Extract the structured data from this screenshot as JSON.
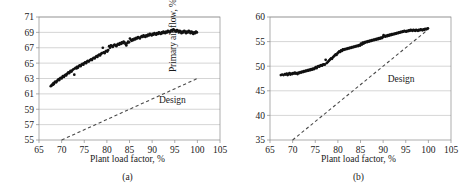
{
  "figure": {
    "panels": [
      "a",
      "b"
    ]
  },
  "chart_data": [
    {
      "type": "scatter",
      "panel": "a",
      "caption": "(a)",
      "title": "",
      "xlabel": "Plant load factor, %",
      "ylabel": "Pressure gain, % of fan capacity",
      "xlim": [
        65,
        105
      ],
      "ylim": [
        55,
        71
      ],
      "xticks": [
        65,
        70,
        75,
        80,
        85,
        90,
        95,
        100,
        105
      ],
      "yticks": [
        55,
        57,
        59,
        61,
        63,
        65,
        67,
        69,
        71
      ],
      "grid": "horizontal",
      "legend": "none",
      "annotations": [
        {
          "text": "Design",
          "x": 91.5,
          "y": 59.8
        }
      ],
      "series": [
        {
          "name": "Design",
          "type": "line",
          "style": "dashed",
          "points": [
            [
              70,
              55
            ],
            [
              100,
              63
            ]
          ]
        },
        {
          "name": "Measured",
          "type": "scatter",
          "marker": "circle",
          "x": [
            67.6,
            67.8,
            67.9,
            68.1,
            68.2,
            68.3,
            68.5,
            68.6,
            68.8,
            69.0,
            69.2,
            69.3,
            69.5,
            69.6,
            69.8,
            70.0,
            70.2,
            70.3,
            70.5,
            70.7,
            70.9,
            71.0,
            71.2,
            71.4,
            71.5,
            71.7,
            71.9,
            72.0,
            72.2,
            72.4,
            72.6,
            72.8,
            72.9,
            73.1,
            73.3,
            73.4,
            73.6,
            73.8,
            74.0,
            74.2,
            74.4,
            74.6,
            74.8,
            75.0,
            75.2,
            75.4,
            75.6,
            75.8,
            76.0,
            76.3,
            76.5,
            76.7,
            76.9,
            77.1,
            77.3,
            77.5,
            77.7,
            77.9,
            78.1,
            78.3,
            78.5,
            78.7,
            78.9,
            79.1,
            79.3,
            79.5,
            79.7,
            79.9,
            80.1,
            80.3,
            80.5,
            80.7,
            80.9,
            81.1,
            81.3,
            81.5,
            81.7,
            81.9,
            82.1,
            82.3,
            82.5,
            82.7,
            82.9,
            83.1,
            83.3,
            83.5,
            83.7,
            83.9,
            84.1,
            84.3,
            84.5,
            84.7,
            84.9,
            85.1,
            85.3,
            85.5,
            85.7,
            85.9,
            86.1,
            86.3,
            86.5,
            86.7,
            86.9,
            87.1,
            87.3,
            87.5,
            87.7,
            87.9,
            88.1,
            88.3,
            88.5,
            88.7,
            88.9,
            89.1,
            89.3,
            89.5,
            89.7,
            89.9,
            90.1,
            90.3,
            90.5,
            90.7,
            90.9,
            91.1,
            91.3,
            91.5,
            91.7,
            91.9,
            92.1,
            92.3,
            92.5,
            92.7,
            92.9,
            93.1,
            93.3,
            93.5,
            93.7,
            93.9,
            94.1,
            94.3,
            94.5,
            94.7,
            94.9,
            95.1,
            95.3,
            95.5,
            95.7,
            95.9,
            96.1,
            96.3,
            96.5,
            96.7,
            96.9,
            97.1,
            97.3,
            97.5,
            97.7,
            97.9,
            98.1,
            98.3,
            98.5,
            98.7,
            98.9,
            99.1,
            99.3,
            99.5,
            99.7,
            99.9
          ],
          "y": [
            62.0,
            62.1,
            62.2,
            62.2,
            62.4,
            62.3,
            62.5,
            62.6,
            62.5,
            62.7,
            62.8,
            62.9,
            62.8,
            63.0,
            63.1,
            63.0,
            63.2,
            63.3,
            63.2,
            63.4,
            63.5,
            63.4,
            63.6,
            63.7,
            63.8,
            63.7,
            63.9,
            64.0,
            63.9,
            64.1,
            64.2,
            63.5,
            64.3,
            64.4,
            64.3,
            64.5,
            64.4,
            64.6,
            64.7,
            64.6,
            64.8,
            64.9,
            64.8,
            65.0,
            65.1,
            65.0,
            65.2,
            65.3,
            65.2,
            65.4,
            65.5,
            65.4,
            65.6,
            65.7,
            65.6,
            65.8,
            65.9,
            65.8,
            66.0,
            66.1,
            66.0,
            66.2,
            66.3,
            67.0,
            66.4,
            66.3,
            66.5,
            66.6,
            66.5,
            66.7,
            67.2,
            67.0,
            67.3,
            67.2,
            67.1,
            67.3,
            67.4,
            67.3,
            67.2,
            67.4,
            67.5,
            67.4,
            67.6,
            67.5,
            67.7,
            67.6,
            67.8,
            67.7,
            67.5,
            67.3,
            67.6,
            67.8,
            67.7,
            68.2,
            68.0,
            67.9,
            68.1,
            68.0,
            68.2,
            68.1,
            68.3,
            68.2,
            68.4,
            68.3,
            68.2,
            68.4,
            68.5,
            68.4,
            68.6,
            68.5,
            68.4,
            68.6,
            68.5,
            68.7,
            68.6,
            68.8,
            68.7,
            68.6,
            68.8,
            68.7,
            68.9,
            68.8,
            68.7,
            68.9,
            68.8,
            69.0,
            68.9,
            68.8,
            69.0,
            68.9,
            69.1,
            69.0,
            68.9,
            69.1,
            69.0,
            69.2,
            69.1,
            69.0,
            69.2,
            69.3,
            69.2,
            69.4,
            69.3,
            69.2,
            69.1,
            69.3,
            69.2,
            69.0,
            69.2,
            69.1,
            68.9,
            69.1,
            69.0,
            69.2,
            69.1,
            68.9,
            69.1,
            69.0,
            69.2,
            69.1,
            68.9,
            69.1,
            69.0,
            68.8,
            69.0,
            68.9,
            69.1,
            69.0
          ]
        }
      ]
    },
    {
      "type": "scatter",
      "panel": "b",
      "caption": "(b)",
      "title": "",
      "xlabel": "Plant load factor, %",
      "ylabel": "Primary air flow, % of fan capacity",
      "xlim": [
        65,
        105
      ],
      "ylim": [
        35,
        60
      ],
      "xticks": [
        65,
        70,
        75,
        80,
        85,
        90,
        95,
        100,
        105
      ],
      "yticks": [
        35,
        40,
        45,
        50,
        55,
        60
      ],
      "grid": "horizontal",
      "legend": "none",
      "annotations": [
        {
          "text": "Design",
          "x": 91.0,
          "y": 46.8
        }
      ],
      "series": [
        {
          "name": "Design",
          "type": "line",
          "style": "dashed",
          "points": [
            [
              70,
              35
            ],
            [
              100,
              57.5
            ]
          ]
        },
        {
          "name": "Measured",
          "type": "scatter",
          "marker": "circle",
          "x": [
            67.4,
            67.7,
            68.0,
            68.3,
            68.5,
            68.7,
            68.9,
            69.1,
            69.3,
            69.5,
            69.7,
            69.9,
            70.1,
            70.3,
            70.5,
            70.7,
            70.9,
            71.1,
            71.3,
            71.5,
            71.7,
            71.9,
            72.1,
            72.3,
            72.5,
            72.7,
            72.9,
            73.1,
            73.3,
            73.5,
            73.7,
            73.9,
            74.1,
            74.3,
            74.5,
            74.7,
            74.9,
            75.1,
            75.3,
            75.5,
            75.7,
            75.9,
            76.1,
            76.3,
            76.5,
            76.7,
            76.9,
            77.1,
            77.3,
            77.5,
            77.7,
            77.9,
            78.1,
            78.3,
            78.5,
            78.7,
            78.9,
            79.1,
            79.3,
            79.5,
            79.7,
            79.9,
            80.1,
            80.3,
            80.5,
            80.7,
            80.9,
            81.1,
            81.3,
            81.5,
            81.7,
            81.9,
            82.1,
            82.3,
            82.5,
            82.7,
            82.9,
            83.1,
            83.3,
            83.5,
            83.7,
            83.9,
            84.1,
            84.3,
            84.5,
            84.7,
            84.9,
            85.1,
            85.3,
            85.5,
            85.7,
            85.9,
            86.1,
            86.3,
            86.5,
            86.7,
            86.9,
            87.1,
            87.3,
            87.5,
            87.7,
            87.9,
            88.1,
            88.3,
            88.5,
            88.7,
            88.9,
            89.1,
            89.3,
            89.5,
            89.7,
            89.9,
            90.1,
            90.3,
            90.5,
            90.7,
            90.9,
            91.1,
            91.3,
            91.5,
            91.7,
            91.9,
            92.1,
            92.3,
            92.5,
            92.7,
            92.9,
            93.1,
            93.3,
            93.5,
            93.7,
            93.9,
            94.1,
            94.3,
            94.5,
            94.7,
            94.9,
            95.1,
            95.3,
            95.5,
            95.7,
            95.9,
            96.1,
            96.3,
            96.5,
            96.7,
            96.9,
            97.1,
            97.3,
            97.5,
            97.7,
            97.9,
            98.1,
            98.3,
            98.5,
            98.7,
            98.9,
            99.1,
            99.3,
            99.5,
            99.7,
            99.9
          ],
          "y": [
            48.2,
            48.3,
            48.2,
            48.4,
            48.3,
            48.5,
            48.2,
            48.4,
            48.6,
            48.3,
            48.5,
            48.4,
            48.6,
            48.5,
            48.7,
            48.5,
            48.6,
            48.4,
            48.7,
            48.6,
            48.8,
            48.7,
            48.9,
            48.8,
            49.0,
            48.9,
            49.1,
            49.0,
            49.2,
            49.1,
            49.3,
            49.2,
            49.4,
            49.3,
            49.5,
            49.4,
            49.6,
            49.8,
            49.6,
            49.9,
            50.0,
            49.9,
            50.1,
            50.2,
            50.1,
            50.3,
            50.4,
            50.3,
            51.3,
            50.6,
            50.8,
            51.0,
            51.2,
            51.4,
            51.6,
            51.5,
            51.8,
            52.0,
            52.2,
            52.4,
            52.3,
            52.6,
            52.8,
            53.0,
            52.9,
            53.2,
            53.1,
            53.4,
            53.3,
            53.5,
            53.4,
            53.6,
            53.5,
            53.7,
            53.6,
            53.8,
            53.7,
            53.9,
            53.8,
            54.0,
            53.9,
            54.1,
            54.0,
            54.2,
            54.1,
            54.3,
            54.2,
            54.6,
            54.4,
            54.8,
            54.6,
            54.9,
            54.8,
            55.0,
            54.9,
            55.1,
            55.0,
            55.2,
            55.1,
            55.3,
            55.2,
            55.4,
            55.3,
            55.5,
            55.4,
            55.6,
            55.5,
            55.7,
            55.6,
            55.8,
            55.7,
            55.9,
            56.3,
            56.1,
            56.0,
            56.2,
            56.1,
            56.3,
            56.2,
            56.4,
            56.3,
            56.5,
            56.4,
            56.6,
            56.5,
            56.7,
            56.6,
            56.8,
            56.7,
            56.9,
            56.8,
            57.0,
            56.9,
            57.1,
            57.0,
            57.2,
            57.1,
            57.0,
            57.2,
            57.1,
            57.3,
            57.2,
            57.4,
            57.3,
            57.2,
            57.4,
            57.3,
            57.2,
            57.4,
            57.3,
            57.2,
            57.4,
            57.3,
            57.5,
            57.4,
            57.3,
            57.5,
            57.4,
            57.6,
            57.5,
            57.6,
            57.7
          ]
        }
      ]
    }
  ]
}
